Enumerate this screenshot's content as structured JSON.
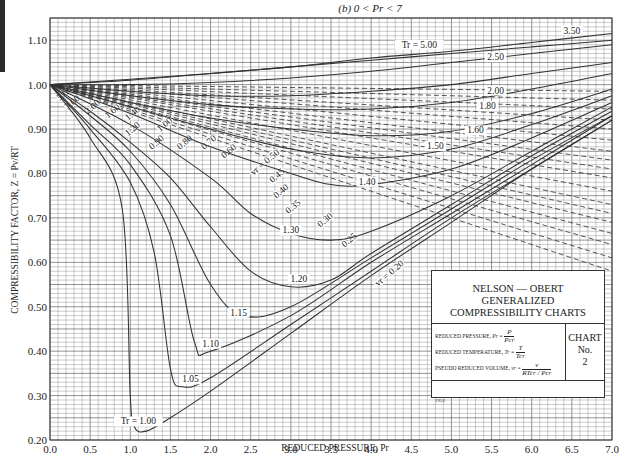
{
  "chart_data": {
    "type": "line",
    "title": "(b) 0 < Pr < 7",
    "xlabel": "REDUCED PRESSURE, Pr",
    "ylabel": "COMPRESSIBILITY FACTOR, Z = Pv/RT",
    "xlim": [
      0.0,
      7.0
    ],
    "ylim": [
      0.2,
      1.15
    ],
    "grid": true,
    "x_ticks": [
      "0.0",
      "0.5",
      "1.0",
      "1.5",
      "2.0",
      "2.5",
      "3.0",
      "3.5",
      "4.0",
      "4.5",
      "5.0",
      "5.5",
      "6.0",
      "6.5",
      "7.0"
    ],
    "y_ticks": [
      "0.20",
      "0.30",
      "0.40",
      "0.50",
      "0.60",
      "0.70",
      "0.80",
      "0.90",
      "1.00",
      "1.10"
    ],
    "legend": "bottom-right",
    "isotherms": [
      {
        "name": "Tr = 1.00",
        "label": "Tr = 1.00",
        "points": [
          [
            0,
            1.0
          ],
          [
            0.5,
            0.88
          ],
          [
            0.9,
            0.72
          ],
          [
            1.0,
            0.3
          ],
          [
            1.05,
            0.23
          ],
          [
            1.2,
            0.22
          ],
          [
            1.5,
            0.25
          ],
          [
            2.0,
            0.31
          ],
          [
            3.0,
            0.44
          ],
          [
            4.0,
            0.57
          ],
          [
            5.0,
            0.69
          ],
          [
            6.0,
            0.81
          ],
          [
            7.0,
            0.92
          ]
        ]
      },
      {
        "name": "Tr = 1.05",
        "label": "1.05",
        "points": [
          [
            0,
            1.0
          ],
          [
            0.5,
            0.9
          ],
          [
            1.0,
            0.78
          ],
          [
            1.3,
            0.62
          ],
          [
            1.5,
            0.36
          ],
          [
            1.65,
            0.32
          ],
          [
            2.0,
            0.34
          ],
          [
            3.0,
            0.46
          ],
          [
            4.0,
            0.58
          ],
          [
            5.0,
            0.7
          ],
          [
            6.0,
            0.81
          ],
          [
            7.0,
            0.92
          ]
        ]
      },
      {
        "name": "Tr = 1.10",
        "label": "1.10",
        "points": [
          [
            0,
            1.0
          ],
          [
            0.5,
            0.91
          ],
          [
            1.0,
            0.82
          ],
          [
            1.5,
            0.66
          ],
          [
            1.8,
            0.42
          ],
          [
            2.0,
            0.4
          ],
          [
            3.0,
            0.48
          ],
          [
            4.0,
            0.6
          ],
          [
            5.0,
            0.71
          ],
          [
            6.0,
            0.82
          ],
          [
            7.0,
            0.93
          ]
        ]
      },
      {
        "name": "Tr = 1.15",
        "label": "1.15",
        "points": [
          [
            0,
            1.0
          ],
          [
            0.5,
            0.93
          ],
          [
            1.0,
            0.85
          ],
          [
            1.5,
            0.73
          ],
          [
            2.0,
            0.55
          ],
          [
            2.4,
            0.48
          ],
          [
            3.0,
            0.5
          ],
          [
            4.0,
            0.61
          ],
          [
            5.0,
            0.72
          ],
          [
            6.0,
            0.83
          ],
          [
            7.0,
            0.93
          ]
        ]
      },
      {
        "name": "Tr = 1.20",
        "label": "1.20",
        "points": [
          [
            0,
            1.0
          ],
          [
            0.5,
            0.94
          ],
          [
            1.0,
            0.87
          ],
          [
            1.5,
            0.79
          ],
          [
            2.0,
            0.68
          ],
          [
            2.5,
            0.58
          ],
          [
            3.0,
            0.545
          ],
          [
            3.5,
            0.56
          ],
          [
            4.0,
            0.62
          ],
          [
            5.0,
            0.73
          ],
          [
            6.0,
            0.84
          ],
          [
            7.0,
            0.94
          ]
        ]
      },
      {
        "name": "Tr = 1.30",
        "label": "1.30",
        "points": [
          [
            0,
            1.0
          ],
          [
            1.0,
            0.91
          ],
          [
            2.0,
            0.79
          ],
          [
            2.5,
            0.71
          ],
          [
            3.0,
            0.665
          ],
          [
            3.5,
            0.65
          ],
          [
            4.0,
            0.67
          ],
          [
            5.0,
            0.75
          ],
          [
            6.0,
            0.85
          ],
          [
            7.0,
            0.95
          ]
        ]
      },
      {
        "name": "Tr = 1.40",
        "label": "1.40",
        "points": [
          [
            0,
            1.0
          ],
          [
            1.0,
            0.935
          ],
          [
            2.0,
            0.86
          ],
          [
            3.0,
            0.8
          ],
          [
            3.5,
            0.775
          ],
          [
            4.0,
            0.775
          ],
          [
            5.0,
            0.81
          ],
          [
            6.0,
            0.88
          ],
          [
            7.0,
            0.96
          ]
        ]
      },
      {
        "name": "Tr = 1.50",
        "label": "1.50",
        "points": [
          [
            0,
            1.0
          ],
          [
            1.0,
            0.95
          ],
          [
            2.0,
            0.9
          ],
          [
            3.0,
            0.855
          ],
          [
            4.0,
            0.835
          ],
          [
            5.0,
            0.855
          ],
          [
            6.0,
            0.91
          ],
          [
            7.0,
            0.975
          ]
        ]
      },
      {
        "name": "Tr = 1.60",
        "label": "1.60",
        "points": [
          [
            0,
            1.0
          ],
          [
            1.0,
            0.96
          ],
          [
            2.0,
            0.925
          ],
          [
            3.0,
            0.9
          ],
          [
            4.0,
            0.885
          ],
          [
            5.0,
            0.895
          ],
          [
            6.0,
            0.935
          ],
          [
            7.0,
            0.99
          ]
        ]
      },
      {
        "name": "Tr = 1.80",
        "label": "1.80",
        "points": [
          [
            0,
            1.0
          ],
          [
            1.0,
            0.975
          ],
          [
            2.0,
            0.955
          ],
          [
            3.0,
            0.945
          ],
          [
            4.0,
            0.945
          ],
          [
            5.0,
            0.96
          ],
          [
            6.0,
            0.99
          ],
          [
            7.0,
            1.025
          ]
        ]
      },
      {
        "name": "Tr = 2.00",
        "label": "2.00",
        "points": [
          [
            0,
            1.0
          ],
          [
            1.0,
            0.985
          ],
          [
            2.0,
            0.975
          ],
          [
            3.0,
            0.975
          ],
          [
            4.0,
            0.985
          ],
          [
            5.0,
            1.0
          ],
          [
            6.0,
            1.025
          ],
          [
            7.0,
            1.05
          ]
        ]
      },
      {
        "name": "Tr = 2.50",
        "label": "2.50",
        "points": [
          [
            0,
            1.0
          ],
          [
            1.0,
            1.0
          ],
          [
            2.0,
            1.005
          ],
          [
            3.0,
            1.015
          ],
          [
            4.0,
            1.03
          ],
          [
            5.0,
            1.05
          ],
          [
            6.0,
            1.07
          ],
          [
            7.0,
            1.09
          ]
        ]
      },
      {
        "name": "Tr = 3.50",
        "label": "3.50",
        "points": [
          [
            0,
            1.0
          ],
          [
            1.0,
            1.01
          ],
          [
            2.0,
            1.025
          ],
          [
            3.0,
            1.04
          ],
          [
            4.0,
            1.06
          ],
          [
            5.0,
            1.075
          ],
          [
            6.0,
            1.095
          ],
          [
            7.0,
            1.115
          ]
        ]
      },
      {
        "name": "Tr = 5.00",
        "label": "Tr = 5.00",
        "points": [
          [
            0,
            1.0
          ],
          [
            1.0,
            1.012
          ],
          [
            2.0,
            1.025
          ],
          [
            3.0,
            1.04
          ],
          [
            4.0,
            1.055
          ],
          [
            5.0,
            1.07
          ],
          [
            6.0,
            1.085
          ],
          [
            7.0,
            1.1
          ]
        ]
      }
    ],
    "pseudo_reduced_volumes": [
      {
        "name": "vr = 5.00",
        "label": "5.00",
        "points": [
          [
            0,
            1.0
          ],
          [
            7.0,
            0.985
          ]
        ]
      },
      {
        "name": "vr = 3.00",
        "label": "3.00",
        "points": [
          [
            0,
            1.0
          ],
          [
            7.0,
            0.965
          ]
        ]
      },
      {
        "name": "vr = 2.00",
        "label": "2.00",
        "points": [
          [
            0,
            1.0
          ],
          [
            7.0,
            0.945
          ]
        ]
      },
      {
        "name": "vr = 1.60",
        "label": "1.60",
        "points": [
          [
            0,
            1.0
          ],
          [
            7.0,
            0.92
          ]
        ]
      },
      {
        "name": "vr = 1.40",
        "label": "1.40",
        "points": [
          [
            0,
            1.0
          ],
          [
            7.0,
            0.9
          ]
        ]
      },
      {
        "name": "vr = 1.20",
        "label": "1.20",
        "points": [
          [
            0,
            1.0
          ],
          [
            7.0,
            0.875
          ]
        ]
      },
      {
        "name": "vr = 1.00",
        "label": "1.00",
        "points": [
          [
            0,
            1.0
          ],
          [
            7.0,
            0.85
          ]
        ]
      },
      {
        "name": "vr = 0.90",
        "label": "0.90",
        "points": [
          [
            0,
            1.0
          ],
          [
            7.0,
            0.83
          ]
        ]
      },
      {
        "name": "vr = 0.80",
        "label": "0.80",
        "points": [
          [
            0,
            1.0
          ],
          [
            7.0,
            0.81
          ]
        ]
      },
      {
        "name": "vr = 0.70",
        "label": "0.70",
        "points": [
          [
            0,
            1.0
          ],
          [
            7.0,
            0.79
          ]
        ]
      },
      {
        "name": "vr = 0.60",
        "label": "0.60",
        "points": [
          [
            0,
            1.0
          ],
          [
            7.0,
            0.76
          ]
        ]
      },
      {
        "name": "vr = 0.50",
        "label": "vr = 0.50",
        "points": [
          [
            0,
            1.0
          ],
          [
            7.0,
            0.73
          ]
        ]
      },
      {
        "name": "vr = 0.45",
        "label": "0.45",
        "points": [
          [
            0,
            1.0
          ],
          [
            7.0,
            0.71
          ]
        ]
      },
      {
        "name": "vr = 0.40",
        "label": "0.40",
        "points": [
          [
            0,
            1.0
          ],
          [
            7.0,
            0.69
          ]
        ]
      },
      {
        "name": "vr = 0.35",
        "label": "0.35",
        "points": [
          [
            0,
            1.0
          ],
          [
            7.0,
            0.665
          ]
        ]
      },
      {
        "name": "vr = 0.30",
        "label": "0.30",
        "points": [
          [
            0,
            1.0
          ],
          [
            7.0,
            0.64
          ]
        ]
      },
      {
        "name": "vr = 0.25",
        "label": "0.25",
        "points": [
          [
            0,
            1.0
          ],
          [
            7.0,
            0.61
          ]
        ]
      },
      {
        "name": "vr = 0.20",
        "label": "vr = 0.20",
        "points": [
          [
            0,
            1.0
          ],
          [
            7.0,
            0.58
          ]
        ]
      }
    ]
  },
  "legend_box": {
    "title_lines": [
      "NELSON — OBERT",
      "GENERALIZED",
      "COMPRESSIBILITY CHARTS"
    ],
    "defs": [
      {
        "label": "REDUCED PRESSURE,",
        "symbol": "Pr =",
        "num": "P",
        "den": "Pcr"
      },
      {
        "label": "REDUCED TEMPERATURE,",
        "symbol": "Tr =",
        "num": "T",
        "den": "Tcr"
      },
      {
        "label": "PSEUDO REDUCED VOLUME,",
        "symbol": "vr =",
        "num": "v",
        "den": "RTcr / Pcr"
      }
    ],
    "chart_label": [
      "CHART",
      "No.",
      "2"
    ],
    "year": "1953"
  }
}
